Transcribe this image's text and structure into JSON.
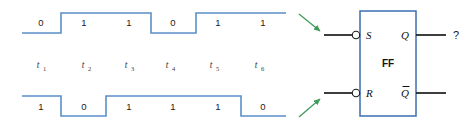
{
  "figure": {
    "colors": {
      "waveform": "#5b8fc9",
      "block_outline": "#3a6fb0",
      "wire": "#1a1a1a",
      "arrow": "#3f9b5a",
      "text": "#1a1a1a",
      "background": "#ffffff"
    }
  },
  "timing": {
    "time_labels": [
      {
        "base": "t",
        "sub": "1"
      },
      {
        "base": "t",
        "sub": "2"
      },
      {
        "base": "t",
        "sub": "3"
      },
      {
        "base": "t",
        "sub": "4"
      },
      {
        "base": "t",
        "sub": "5"
      },
      {
        "base": "t",
        "sub": "6"
      }
    ],
    "waveforms": [
      {
        "name": "S",
        "position": "top",
        "values": [
          "0",
          "1",
          "1",
          "0",
          "1",
          "1"
        ]
      },
      {
        "name": "R",
        "position": "bottom",
        "values": [
          "1",
          "0",
          "1",
          "1",
          "1",
          "0"
        ]
      }
    ]
  },
  "flipflop": {
    "body_label": "FF",
    "inputs": [
      {
        "label": "S",
        "inverted": true
      },
      {
        "label": "R",
        "inverted": true
      }
    ],
    "outputs": [
      {
        "label": "Q",
        "overbar": false,
        "value": "?"
      },
      {
        "label": "Q",
        "overbar": true,
        "value": ""
      }
    ],
    "output_question": "?"
  },
  "annotations": {
    "arrows": [
      {
        "name": "arrow-to-s-input",
        "direction": "down-right"
      },
      {
        "name": "arrow-to-r-input",
        "direction": "up-right"
      }
    ]
  }
}
